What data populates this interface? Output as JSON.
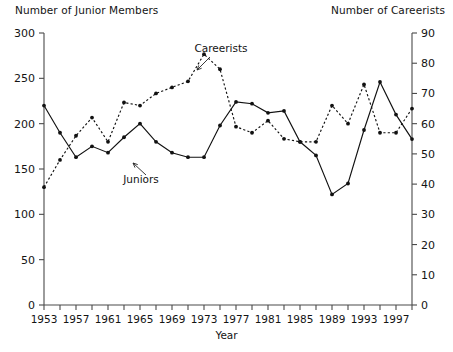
{
  "axis_titles": {
    "left": "Number of Junior Members",
    "right": "Number of Careerists"
  },
  "xlabel": "Year",
  "annotations": {
    "juniors": "Juniors",
    "careerists": "Careerists"
  },
  "chart_data": {
    "type": "line",
    "title": "",
    "xlabel": "Year",
    "ylabel": "Number of Junior Members",
    "y2label": "Number of Careerists",
    "grid": false,
    "legend": "inline-annotations",
    "xlim": [
      1953,
      1999
    ],
    "ylim": [
      0,
      300
    ],
    "y2lim": [
      0,
      90
    ],
    "x_tick_step": 2,
    "x_label_step": 4,
    "x_tick_labels": [
      "1953",
      "1957",
      "1961",
      "1965",
      "1969",
      "1973",
      "1977",
      "1981",
      "1985",
      "1989",
      "1993",
      "1997"
    ],
    "y_tick_labels": [
      "0",
      "50",
      "100",
      "150",
      "200",
      "250",
      "300"
    ],
    "y2_tick_labels": [
      "0",
      "10",
      "20",
      "30",
      "40",
      "50",
      "60",
      "70",
      "80",
      "90"
    ],
    "x": [
      1953,
      1955,
      1957,
      1959,
      1961,
      1963,
      1965,
      1967,
      1969,
      1971,
      1973,
      1975,
      1977,
      1979,
      1981,
      1983,
      1985,
      1987,
      1989,
      1991,
      1993,
      1995,
      1997,
      1999
    ],
    "series": [
      {
        "name": "Juniors",
        "axis": "left",
        "style": "solid",
        "marker": "filled-circle",
        "color": "#111111",
        "values": [
          220,
          190,
          163,
          175,
          168,
          185,
          200,
          180,
          168,
          163,
          163,
          198,
          224,
          222,
          212,
          214,
          180,
          165,
          122,
          134,
          193,
          246,
          210,
          183
        ]
      },
      {
        "name": "Careerists",
        "axis": "right",
        "style": "dotted",
        "marker": "filled-circle",
        "color": "#111111",
        "values": [
          39,
          48,
          56,
          62,
          54,
          67,
          66,
          70,
          72,
          74,
          83,
          78,
          59,
          57,
          61,
          55,
          54,
          54,
          66,
          60,
          73,
          57,
          57,
          65
        ]
      }
    ]
  }
}
